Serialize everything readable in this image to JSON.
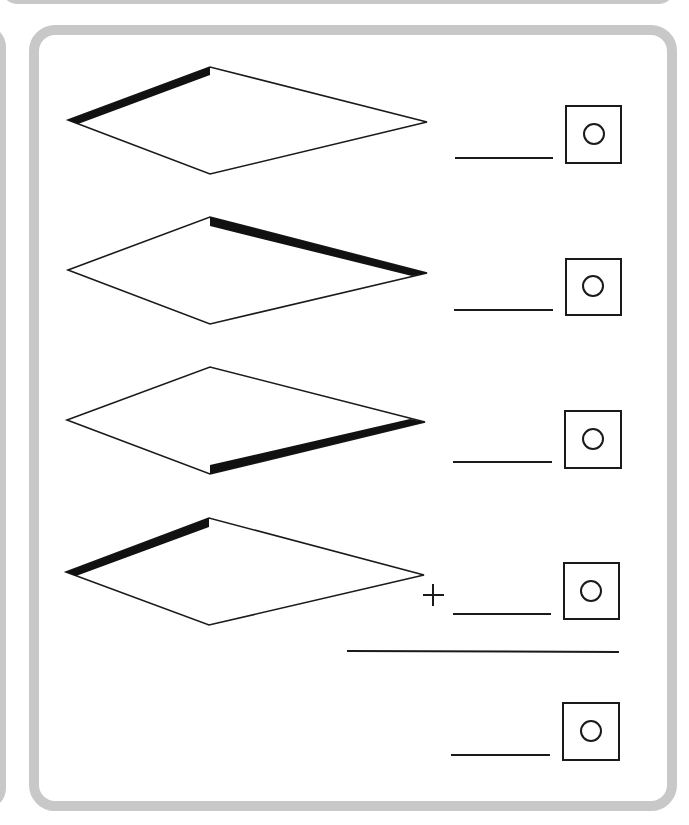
{
  "worksheet": {
    "type": "kite-perimeter-addition",
    "rows": [
      {
        "highlighted_edge": "upper-left",
        "answer": "",
        "unit_symbol": "○"
      },
      {
        "highlighted_edge": "upper-right",
        "answer": "",
        "unit_symbol": "○"
      },
      {
        "highlighted_edge": "lower-right",
        "answer": "",
        "unit_symbol": "○"
      },
      {
        "highlighted_edge": "upper-left",
        "answer": "",
        "unit_symbol": "○",
        "operator": "+"
      }
    ],
    "total": {
      "answer": "",
      "unit_symbol": "○"
    }
  },
  "colors": {
    "frame": "#c8c8c8",
    "ink": "#1a1a1a",
    "highlight": "#111111"
  }
}
